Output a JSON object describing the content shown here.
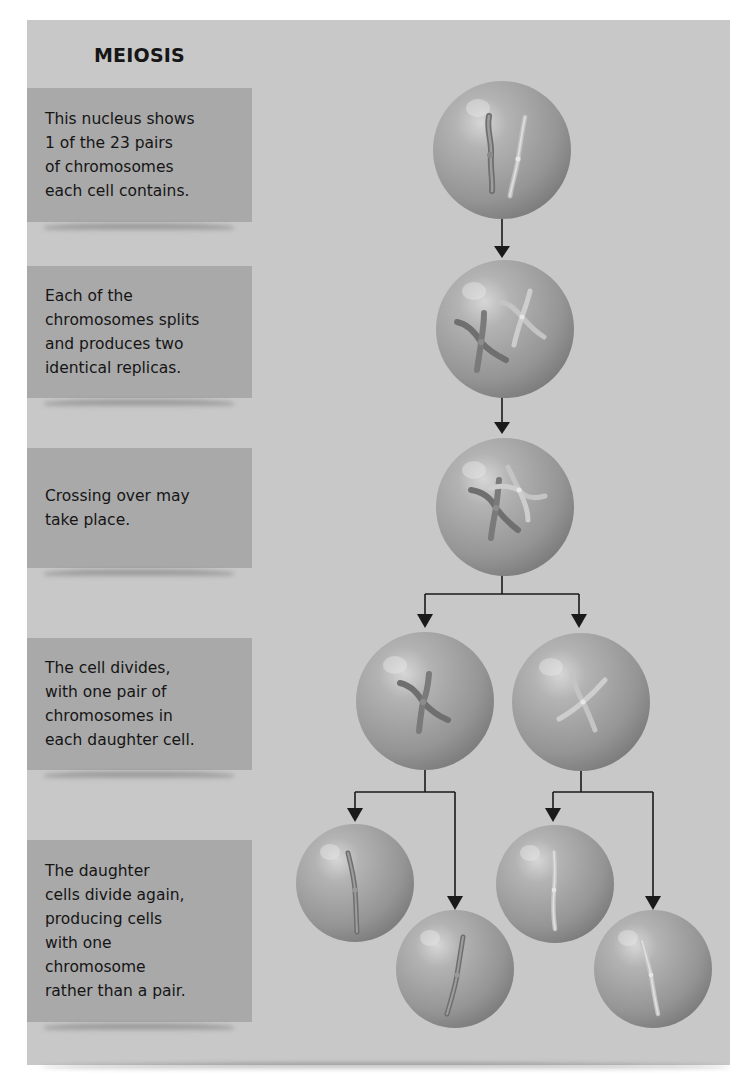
{
  "diagram": {
    "title": "MEIOSIS",
    "steps": [
      {
        "label": "This nucleus shows\n1 of the 23 pairs\nof chromosomes\neach cell contains."
      },
      {
        "label": "Each of the\nchromosomes splits\nand produces two\nidentical replicas."
      },
      {
        "label": "Crossing over may\ntake place."
      },
      {
        "label": "The cell divides,\nwith one pair of\nchromosomes in\neach daughter cell."
      },
      {
        "label": "The daughter\ncells divide again,\nproducing cells\nwith one\nchromosome\nrather than a pair."
      }
    ],
    "cells": [
      {
        "id": "nucleus",
        "stage": 1,
        "content": "chromosome pair (unreplicated)"
      },
      {
        "id": "replicated",
        "stage": 2,
        "content": "two replicated chromosomes"
      },
      {
        "id": "crossing-over",
        "stage": 3,
        "content": "replicated chromosomes crossing over"
      },
      {
        "id": "daughter-1",
        "stage": 4,
        "content": "one replicated chromosome (dark)"
      },
      {
        "id": "daughter-2",
        "stage": 4,
        "content": "one replicated chromosome (light)"
      },
      {
        "id": "gamete-1",
        "stage": 5,
        "content": "single chromosome (dark)"
      },
      {
        "id": "gamete-2",
        "stage": 5,
        "content": "single chromosome (dark)"
      },
      {
        "id": "gamete-3",
        "stage": 5,
        "content": "single chromosome (light)"
      },
      {
        "id": "gamete-4",
        "stage": 5,
        "content": "single chromosome (light)"
      }
    ],
    "colors": {
      "panel": "#c8c8c8",
      "step_box": "#a9a9a9",
      "cell": "#9a9a9a",
      "arrow": "#1a1a1a"
    }
  }
}
